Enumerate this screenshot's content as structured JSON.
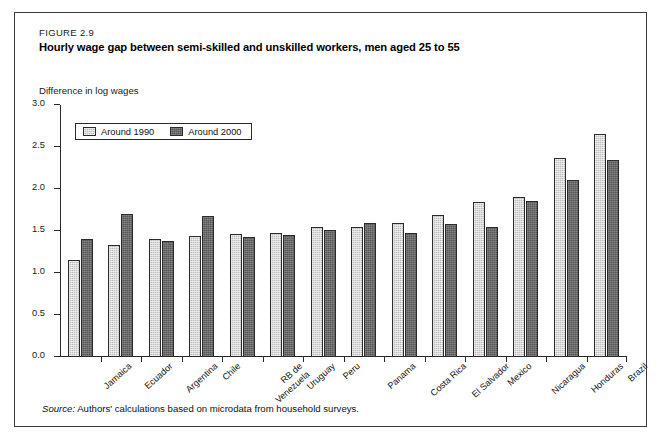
{
  "figure": {
    "number": "FIGURE 2.9",
    "title": "Hourly wage gap between semi-skilled and unskilled workers, men aged 25 to 55",
    "axis_caption": "Difference in log wages",
    "source_label": "Source:",
    "source_text": "Authors' calculations based on microdata from household surveys."
  },
  "legend": {
    "position": "top-left-inside",
    "items": [
      {
        "label": "Around 1990",
        "color": "#bdbdbd"
      },
      {
        "label": "Around 2000",
        "color": "#565656"
      }
    ]
  },
  "chart_data": {
    "type": "bar",
    "title": "Hourly wage gap between semi-skilled and unskilled workers, men aged 25 to 55",
    "subtitle": "FIGURE 2.9",
    "xlabel": "",
    "ylabel": "Difference in log wages",
    "ylim": [
      0.0,
      3.0
    ],
    "yticks": [
      "0.0",
      "0.5",
      "1.0",
      "1.5",
      "2.0",
      "2.5",
      "3.0"
    ],
    "ytick_values": [
      0.0,
      0.5,
      1.0,
      1.5,
      2.0,
      2.5,
      3.0
    ],
    "grid": false,
    "legend_position": "upper left",
    "categories": [
      "Jamaica",
      "Ecuador",
      "Argentina",
      "Chile",
      "RB de\nVenezuela",
      "Uruguay",
      "Peru",
      "Panama",
      "Costa Rica",
      "El Salvador",
      "Mexico",
      "Nicaragua",
      "Honduras",
      "Brazil"
    ],
    "series": [
      {
        "name": "Around 1990",
        "color": "#bdbdbd",
        "values": [
          1.16,
          1.33,
          1.4,
          1.44,
          1.47,
          1.48,
          1.55,
          1.55,
          1.59,
          1.69,
          1.84,
          1.9,
          2.37,
          2.65
        ]
      },
      {
        "name": "Around 2000",
        "color": "#565656",
        "values": [
          1.4,
          1.7,
          1.38,
          1.68,
          1.43,
          1.45,
          1.51,
          1.59,
          1.48,
          1.58,
          1.55,
          1.86,
          2.11,
          2.34
        ]
      }
    ]
  }
}
